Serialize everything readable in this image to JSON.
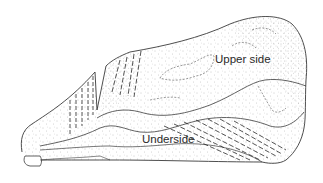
{
  "figure": {
    "labels": {
      "upper": "Upper side",
      "under": "Underside"
    },
    "colors": {
      "line": "#3a3a3a",
      "stipple": "#8a8a8a",
      "background": "#ffffff"
    }
  }
}
